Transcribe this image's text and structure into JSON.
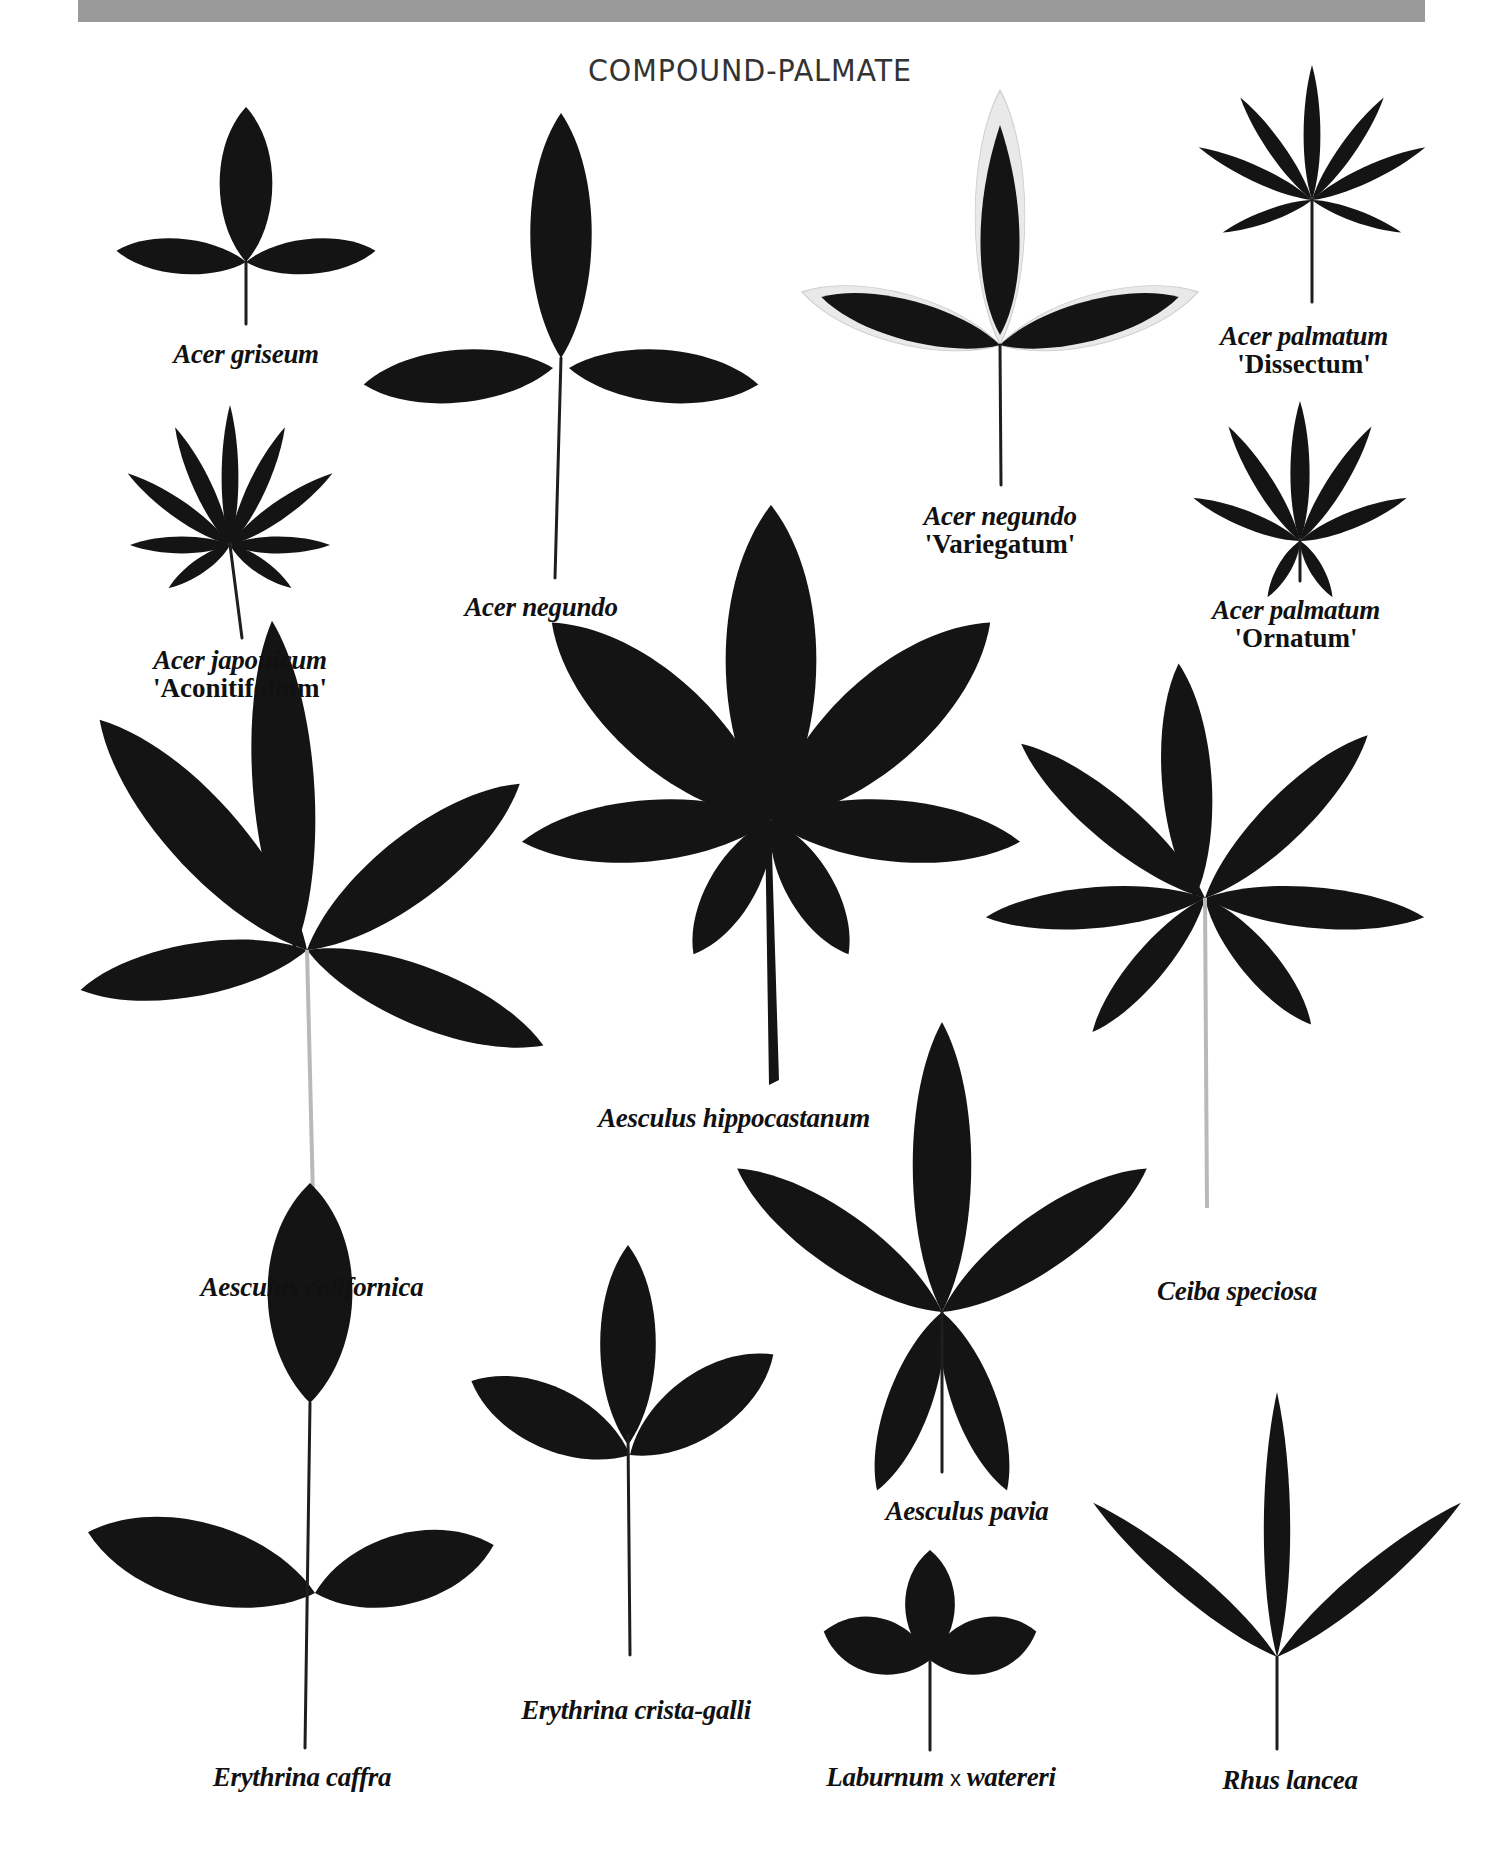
{
  "page": {
    "title": "COMPOUND-PALMATE",
    "header_bar_color": "#9a9a9a",
    "leaf_color": "#141414"
  },
  "specimens": [
    {
      "id": "acer-griseum",
      "species": "Acer griseum",
      "cultivar": ""
    },
    {
      "id": "acer-negundo",
      "species": "Acer negundo",
      "cultivar": ""
    },
    {
      "id": "acer-negundo-variegatum",
      "species": "Acer negundo",
      "cultivar": "'Variegatum'"
    },
    {
      "id": "acer-palmatum-dissectum",
      "species": "Acer palmatum",
      "cultivar": "'Dissectum'"
    },
    {
      "id": "acer-japonicum-aconitifolium",
      "species": "Acer japonicum",
      "cultivar": "'Aconitifolium'"
    },
    {
      "id": "acer-palmatum-ornatum",
      "species": "Acer palmatum",
      "cultivar": "'Ornatum'"
    },
    {
      "id": "aesculus-hippocastanum",
      "species": "Aesculus hippocastanum",
      "cultivar": ""
    },
    {
      "id": "aesculus-californica",
      "species": "Aesculus californica",
      "cultivar": ""
    },
    {
      "id": "ceiba-speciosa",
      "species": "Ceiba speciosa",
      "cultivar": ""
    },
    {
      "id": "aesculus-pavia",
      "species": "Aesculus pavia",
      "cultivar": ""
    },
    {
      "id": "erythrina-crista-galli",
      "species": "Erythrina crista-galli",
      "cultivar": ""
    },
    {
      "id": "erythrina-caffra",
      "species": "Erythrina caffra",
      "cultivar": ""
    },
    {
      "id": "laburnum-watereri",
      "species_part1": "Laburnum",
      "hybrid_sign": "x",
      "species_part2": "watereri"
    },
    {
      "id": "rhus-lancea",
      "species": "Rhus lancea",
      "cultivar": ""
    }
  ]
}
